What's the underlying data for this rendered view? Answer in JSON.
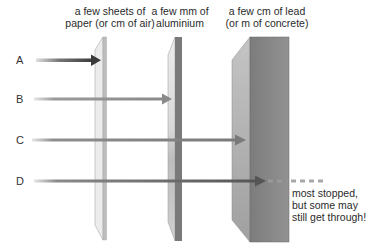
{
  "materials": [
    {
      "id": "paper",
      "label_line1": "a few sheets of",
      "label_line2": "paper (or cm of air)"
    },
    {
      "id": "aluminium",
      "label_line1": "a few mm of",
      "label_line2": "aluminium"
    },
    {
      "id": "lead",
      "label_line1": "a few cm of lead",
      "label_line2": "(or m of concrete)"
    }
  ],
  "rays": [
    {
      "label": "A",
      "stopped_by": "paper"
    },
    {
      "label": "B",
      "stopped_by": "aluminium"
    },
    {
      "label": "C",
      "stopped_by": "lead"
    },
    {
      "label": "D",
      "stopped_by": "none (mostly stopped)"
    }
  ],
  "note": {
    "line1": "most stopped,",
    "line2": "but some may",
    "line3": "still get through!"
  },
  "colors": {
    "paper_front": "#bdbdbd",
    "paper_side": "#e6e6e6",
    "aluminium_front": "#7a7a7a",
    "aluminium_side": "#d0d0d0",
    "lead_front": "#8a8a8a",
    "lead_side": "#b0b0b0",
    "arrow_A": "#4a4a4a",
    "arrow_B": "#8a8a8a",
    "arrow_C": "#7f7f7f",
    "arrow_D": "#666666",
    "dashes": "#a8a8a8"
  }
}
